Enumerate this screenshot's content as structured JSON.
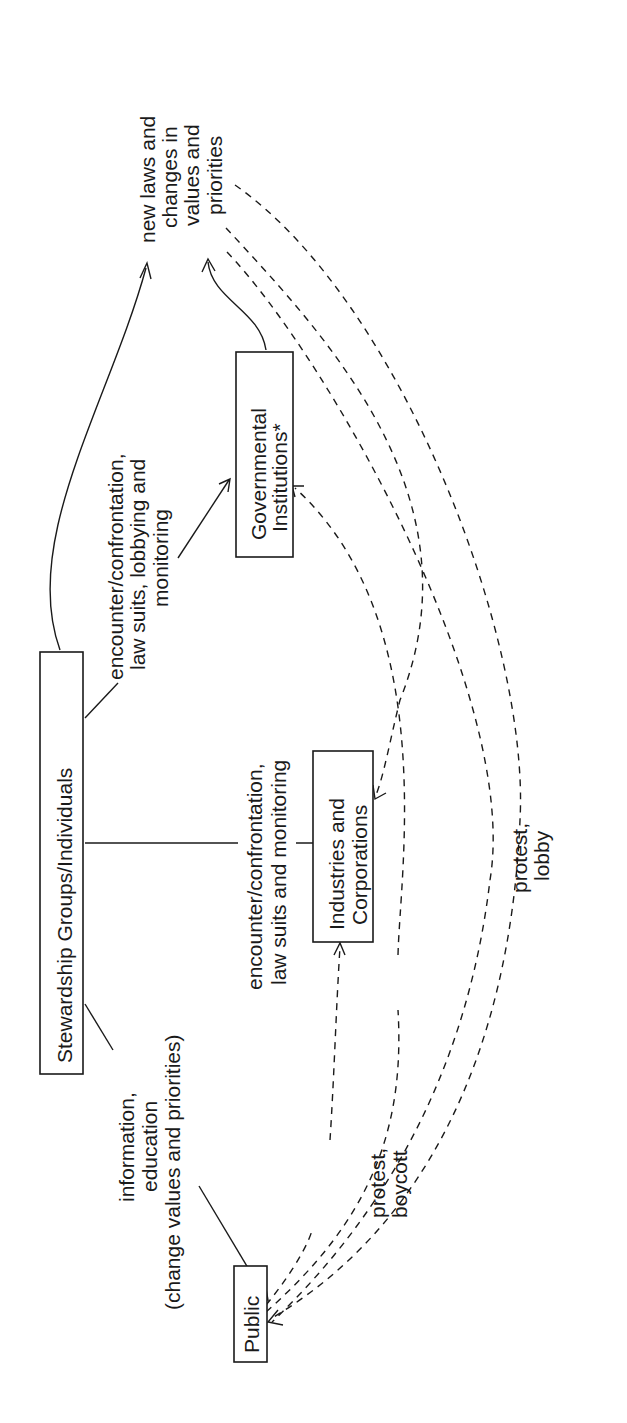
{
  "diagram": {
    "orientation": "rotated 90 degrees counter-clockwise",
    "nodes": {
      "stewardship": "Stewardship Groups/Individuals",
      "government": [
        "Governmental",
        "Institutions*"
      ],
      "industries": [
        "Industries and",
        "Corporations"
      ],
      "public": "Public",
      "outcome": [
        "new laws and",
        "changes in",
        "values and",
        "priorities"
      ]
    },
    "labels": {
      "to_government": [
        "encounter/confrontation,",
        "law suits, lobbying and",
        "monitoring"
      ],
      "to_industries": [
        "encounter/confrontation,",
        "law suits and monitoring"
      ],
      "to_public": [
        "information,",
        "education",
        "(change values and priorities)"
      ],
      "public_to_industries": [
        "protest,",
        "boycott"
      ],
      "public_to_government": [
        "protest,",
        "lobby"
      ]
    },
    "edges": [
      {
        "from": "Stewardship Groups/Individuals",
        "to": "new laws and changes in values and priorities",
        "style": "solid"
      },
      {
        "from": "Stewardship Groups/Individuals",
        "to": "Governmental Institutions*",
        "style": "solid",
        "label": "encounter/confrontation, law suits, lobbying and monitoring"
      },
      {
        "from": "Stewardship Groups/Individuals",
        "to": "Industries and Corporations",
        "style": "solid",
        "label": "encounter/confrontation, law suits and monitoring"
      },
      {
        "from": "Stewardship Groups/Individuals",
        "to": "Public",
        "style": "solid",
        "label": "information, education (change values and priorities)"
      },
      {
        "from": "Governmental Institutions*",
        "to": "new laws and changes in values and priorities",
        "style": "solid"
      },
      {
        "from": "Public",
        "to": "Industries and Corporations",
        "style": "dashed",
        "label": "protest, boycott"
      },
      {
        "from": "Public",
        "to": "Governmental Institutions*",
        "style": "dashed",
        "label": "protest, lobby"
      },
      {
        "from": "new laws and changes in values and priorities",
        "to": "Industries and Corporations",
        "style": "dashed"
      },
      {
        "from": "new laws and changes in values and priorities",
        "to": "Public",
        "style": "dashed"
      }
    ]
  }
}
